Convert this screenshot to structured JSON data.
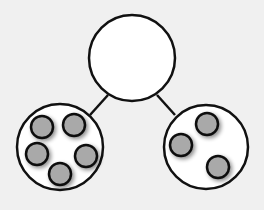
{
  "diagram": {
    "type": "number-bond",
    "colors": {
      "background": "#f0f0f0",
      "stroke": "#111111",
      "circle_fill": "#ffffff",
      "dot_fill": "#a9a9a9",
      "dot_shadow": "#8a8a8a"
    },
    "whole": {
      "cx": 132,
      "cy": 58,
      "r": 43,
      "value": ""
    },
    "parts": [
      {
        "name": "left-part",
        "cx": 60,
        "cy": 147,
        "r": 43,
        "count": 5,
        "dots": [
          [
            42,
            127
          ],
          [
            74,
            125
          ],
          [
            37,
            154
          ],
          [
            86,
            156
          ],
          [
            60,
            174
          ]
        ]
      },
      {
        "name": "right-part",
        "cx": 206,
        "cy": 147,
        "r": 42,
        "count": 3,
        "dots": [
          [
            207,
            124
          ],
          [
            181,
            145
          ],
          [
            218,
            167
          ]
        ]
      }
    ],
    "dot_radius": 11,
    "connectors": [
      {
        "x1": 108,
        "y1": 95,
        "x2": 90,
        "y2": 115
      },
      {
        "x1": 157,
        "y1": 95,
        "x2": 175,
        "y2": 115
      }
    ]
  }
}
